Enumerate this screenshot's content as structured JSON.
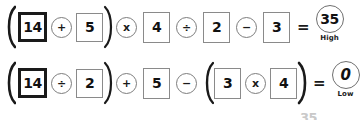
{
  "worksheet": {
    "title": "Order of operations equation worksheet",
    "artifact_text": "35",
    "rows": [
      {
        "id": "equation-row-1",
        "open_paren": "(",
        "close_paren": ")",
        "tokens": [
          {
            "kind": "paren-open",
            "text": "(",
            "name": "open-paren"
          },
          {
            "kind": "box",
            "text": "14",
            "style": "thick",
            "name": "number-box-14"
          },
          {
            "kind": "op",
            "text": "+",
            "name": "operator-plus"
          },
          {
            "kind": "box",
            "text": "5",
            "style": "thin",
            "name": "number-box-5"
          },
          {
            "kind": "paren-close",
            "text": ")",
            "name": "close-paren"
          },
          {
            "kind": "op",
            "text": "x",
            "name": "operator-multiply"
          },
          {
            "kind": "box",
            "text": "4",
            "style": "thin",
            "name": "number-box-4"
          },
          {
            "kind": "op",
            "text": "÷",
            "name": "operator-divide"
          },
          {
            "kind": "box",
            "text": "2",
            "style": "thin",
            "name": "number-box-2"
          },
          {
            "kind": "op",
            "text": "−",
            "name": "operator-minus"
          },
          {
            "kind": "box",
            "text": "3",
            "style": "thin",
            "name": "number-box-3"
          }
        ],
        "equals": "=",
        "result": "35",
        "result_label": "High",
        "result_italic": false
      },
      {
        "id": "equation-row-2",
        "tokens": [
          {
            "kind": "paren-open",
            "text": "(",
            "name": "open-paren"
          },
          {
            "kind": "box",
            "text": "14",
            "style": "thick",
            "name": "number-box-14"
          },
          {
            "kind": "op",
            "text": "÷",
            "name": "operator-divide"
          },
          {
            "kind": "box",
            "text": "2",
            "style": "thin",
            "name": "number-box-2"
          },
          {
            "kind": "paren-close",
            "text": ")",
            "name": "close-paren"
          },
          {
            "kind": "op",
            "text": "+",
            "name": "operator-plus"
          },
          {
            "kind": "box",
            "text": "5",
            "style": "thin",
            "name": "number-box-5"
          },
          {
            "kind": "op",
            "text": "−",
            "name": "operator-minus"
          },
          {
            "kind": "paren-open",
            "text": "(",
            "name": "open-paren-2"
          },
          {
            "kind": "box",
            "text": "3",
            "style": "thin",
            "name": "number-box-3"
          },
          {
            "kind": "op",
            "text": "x",
            "name": "operator-multiply"
          },
          {
            "kind": "box",
            "text": "4",
            "style": "thin",
            "name": "number-box-4"
          },
          {
            "kind": "paren-close",
            "text": ")",
            "name": "close-paren-2"
          }
        ],
        "equals": "=",
        "result": "0",
        "result_label": "Low",
        "result_italic": true
      }
    ],
    "colors": {
      "ink": "#111111",
      "box_border": "#8a8a8a",
      "box_border_thick": "#1a1a1a",
      "circle_border": "#7d7d7d",
      "background": "#ffffff"
    }
  }
}
